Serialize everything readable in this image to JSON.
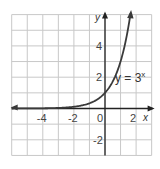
{
  "chart_data": {
    "type": "line",
    "title": "",
    "function": "y = 3^x",
    "xlabel": "x",
    "ylabel": "y",
    "xlim": [
      -6,
      3
    ],
    "ylim": [
      -3,
      6
    ],
    "grid": true,
    "x_ticks": [
      {
        "value": -4,
        "label": "-4"
      },
      {
        "value": -2,
        "label": "-2"
      },
      {
        "value": 0,
        "label": "0"
      },
      {
        "value": 2,
        "label": "2"
      }
    ],
    "y_ticks": [
      {
        "value": 4,
        "label": "4"
      },
      {
        "value": 2,
        "label": "2"
      },
      {
        "value": -2,
        "label": "-2"
      }
    ],
    "series": [
      {
        "name": "y = 3^x",
        "x": [
          -6,
          -5,
          -4,
          -3,
          -2,
          -1,
          0,
          0.5,
          1,
          1.5,
          1.63
        ],
        "values": [
          0.0014,
          0.0041,
          0.0123,
          0.037,
          0.111,
          0.333,
          1,
          1.732,
          3,
          5.196,
          6
        ]
      }
    ],
    "annotations": [
      {
        "text": "y = 3",
        "superscript": "x",
        "x": 1.1,
        "y": 2.2
      }
    ]
  },
  "labels": {
    "x_axis": "x",
    "y_axis": "y",
    "equation_base": "y = 3",
    "equation_exp": "x"
  },
  "colors": {
    "grid": "#c8c8c8",
    "axis": "#222222",
    "curve": "#3a3a3a",
    "text": "#444444"
  }
}
